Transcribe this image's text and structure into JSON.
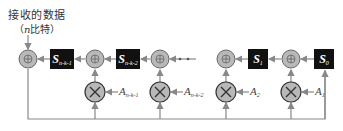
{
  "input_label": {
    "line1": "接收的数据",
    "line2_prefix": "（",
    "line2_var": "n",
    "line2_suffix": "比特）"
  },
  "registers": [
    {
      "id": "S_n-k-1",
      "base": "S",
      "sub": "n-k-1"
    },
    {
      "id": "S_n-k-2",
      "base": "S",
      "sub": "n-k-2"
    },
    {
      "id": "S_1",
      "base": "S",
      "sub": "1"
    },
    {
      "id": "S_0",
      "base": "S",
      "sub": "0"
    }
  ],
  "coefficients": [
    {
      "id": "A_n-k-1",
      "base": "A",
      "sub": "n-k-1"
    },
    {
      "id": "A_n-k-2",
      "base": "A",
      "sub": "n-k-2"
    },
    {
      "id": "A_2",
      "base": "A",
      "sub": "2"
    },
    {
      "id": "A_1",
      "base": "A",
      "sub": "1"
    }
  ],
  "ellipsis": "· · ·",
  "symbols": {
    "adder": "⊕",
    "multiplier": "⊗"
  },
  "colors": {
    "node_fill": "#b8b8b8",
    "register_fill": "#111111",
    "line": "#888888"
  }
}
